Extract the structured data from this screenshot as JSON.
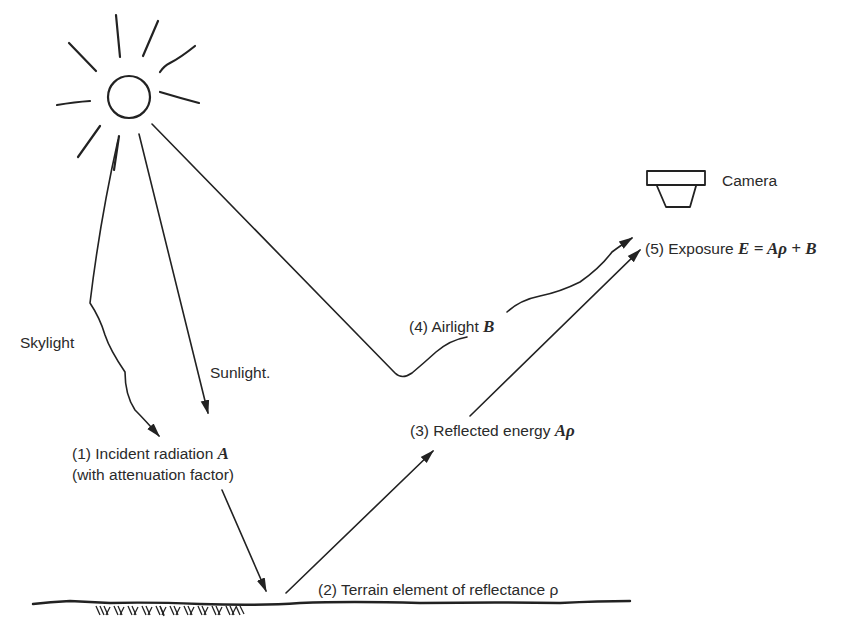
{
  "diagram": {
    "type": "remote-sensing radiation path schematic",
    "labels": {
      "camera": "Camera",
      "exposure_prefix": "(5) Exposure ",
      "exposure_formula": "E = Aρ + B",
      "airlight_prefix": "(4) Airlight ",
      "airlight_symbol": "B",
      "reflected_prefix": "(3) Reflected energy ",
      "reflected_symbol": "Aρ",
      "incident_line1_prefix": "(1) Incident radiation ",
      "incident_symbol": "A",
      "incident_line2": "(with attenuation factor)",
      "terrain": "(2) Terrain element of reflectance ρ",
      "skylight": "Skylight",
      "sunlight": "Sunlight."
    },
    "nodes": [
      {
        "id": "sun",
        "label": "Sun"
      },
      {
        "id": "camera",
        "label": "Camera"
      },
      {
        "id": "terrain",
        "label": "(2) Terrain element of reflectance ρ"
      }
    ],
    "edges": [
      {
        "from": "sun",
        "to": "incident",
        "label": "Skylight",
        "style": "wavy arrow"
      },
      {
        "from": "sun",
        "to": "incident",
        "label": "Sunlight",
        "style": "straight arrow"
      },
      {
        "from": "incident",
        "to": "terrain",
        "label": "(1) Incident radiation A",
        "style": "straight arrow"
      },
      {
        "from": "terrain",
        "to": "camera",
        "label": "(3) Reflected energy Aρ",
        "style": "straight arrow"
      },
      {
        "from": "sun",
        "to": "camera",
        "label": "(4) Airlight B",
        "style": "scattered path arrow"
      }
    ],
    "colors": {
      "ink": "#222222",
      "background": "#ffffff"
    }
  }
}
